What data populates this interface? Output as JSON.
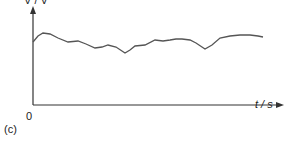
{
  "figure_label": "(c)",
  "chart_data": {
    "type": "line",
    "title": "",
    "xlabel": "t / s",
    "ylabel": "V / V",
    "origin_label": "0",
    "grid": false,
    "legend": null,
    "series": [
      {
        "name": "voltage",
        "points": [
          [
            33,
            42
          ],
          [
            38,
            36
          ],
          [
            43,
            33
          ],
          [
            50,
            34
          ],
          [
            58,
            38
          ],
          [
            68,
            42
          ],
          [
            78,
            41
          ],
          [
            86,
            44
          ],
          [
            95,
            48
          ],
          [
            102,
            47
          ],
          [
            108,
            45
          ],
          [
            116,
            47
          ],
          [
            125,
            53
          ],
          [
            130,
            50
          ],
          [
            135,
            46
          ],
          [
            145,
            45
          ],
          [
            155,
            40
          ],
          [
            163,
            41
          ],
          [
            170,
            40
          ],
          [
            176,
            39
          ],
          [
            182,
            39
          ],
          [
            190,
            40
          ],
          [
            196,
            43
          ],
          [
            205,
            49
          ],
          [
            212,
            45
          ],
          [
            220,
            38
          ],
          [
            230,
            36
          ],
          [
            240,
            35
          ],
          [
            250,
            35
          ],
          [
            258,
            36
          ],
          [
            263,
            37
          ]
        ]
      }
    ]
  }
}
